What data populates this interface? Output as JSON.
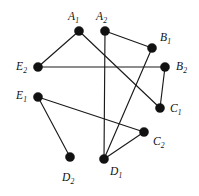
{
  "figure": {
    "type": "undirected-graph-diagram",
    "background_color": "#ffffff",
    "vertex_color": "#111111",
    "edge_color": "#1a1a1a",
    "vertex_radius": 4.6,
    "edge_width": 1.15,
    "width": 199,
    "height": 196
  },
  "vertices": [
    {
      "id": "A1",
      "base": "A",
      "sub": "1",
      "x": 79,
      "y": 31,
      "label_x": 68,
      "label_y": 11
    },
    {
      "id": "A2",
      "base": "A",
      "sub": "2",
      "x": 105,
      "y": 31,
      "label_x": 96,
      "label_y": 11
    },
    {
      "id": "B1",
      "base": "B",
      "sub": "1",
      "x": 152,
      "y": 48,
      "label_x": 160,
      "label_y": 32
    },
    {
      "id": "B2",
      "base": "B",
      "sub": "2",
      "x": 165,
      "y": 67,
      "label_x": 176,
      "label_y": 61
    },
    {
      "id": "C1",
      "base": "C",
      "sub": "1",
      "x": 160,
      "y": 108,
      "label_x": 170,
      "label_y": 103
    },
    {
      "id": "C2",
      "base": "C",
      "sub": "2",
      "x": 144,
      "y": 132,
      "label_x": 153,
      "label_y": 136
    },
    {
      "id": "D1",
      "base": "D",
      "sub": "1",
      "x": 104,
      "y": 159,
      "label_x": 110,
      "label_y": 166
    },
    {
      "id": "D2",
      "base": "D",
      "sub": "2",
      "x": 70,
      "y": 157,
      "label_x": 62,
      "label_y": 172
    },
    {
      "id": "E1",
      "base": "E",
      "sub": "1",
      "x": 38,
      "y": 97,
      "label_x": 16,
      "label_y": 90
    },
    {
      "id": "E2",
      "base": "E",
      "sub": "2",
      "x": 38,
      "y": 67,
      "label_x": 16,
      "label_y": 61
    }
  ],
  "edges": [
    {
      "from": "A1",
      "to": "E2"
    },
    {
      "from": "A1",
      "to": "C1"
    },
    {
      "from": "A2",
      "to": "D1"
    },
    {
      "from": "A2",
      "to": "B1"
    },
    {
      "from": "E2",
      "to": "B2"
    },
    {
      "from": "B1",
      "to": "D1"
    },
    {
      "from": "B2",
      "to": "C1"
    },
    {
      "from": "E1",
      "to": "C2"
    },
    {
      "from": "E1",
      "to": "D2"
    },
    {
      "from": "D1",
      "to": "C2"
    }
  ]
}
